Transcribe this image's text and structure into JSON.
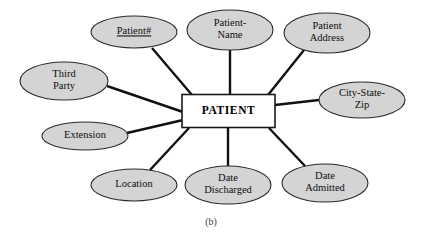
{
  "figure": {
    "caption": "(b)",
    "diagram_type": "entity-relationship-attribute-diagram",
    "colors": {
      "background": "#ffffff",
      "attribute_fill": "#d4d4d4",
      "attribute_stroke": "#2a2a2a",
      "entity_fill": "#ffffff",
      "entity_stroke": "#1a1a1a",
      "connector": "#111111",
      "text": "#0d0d0d"
    }
  },
  "entity": {
    "name": "PATIENT",
    "shape": "rectangle",
    "x": 228.5,
    "y": 111,
    "width": 93,
    "height": 33
  },
  "attributes": [
    {
      "id": "patient-number",
      "lines": [
        "Patient#"
      ],
      "is_key": true,
      "cx": 134,
      "cy": 32,
      "rx": 43,
      "ry": 16
    },
    {
      "id": "patient-name",
      "lines": [
        "Patient-",
        "Name"
      ],
      "is_key": false,
      "cx": 230,
      "cy": 30,
      "rx": 43,
      "ry": 20
    },
    {
      "id": "patient-address",
      "lines": [
        "Patient",
        "Address"
      ],
      "is_key": false,
      "cx": 327,
      "cy": 33,
      "rx": 43,
      "ry": 20
    },
    {
      "id": "city-state-zip",
      "lines": [
        "City-State-",
        "Zip"
      ],
      "is_key": false,
      "cx": 362,
      "cy": 100,
      "rx": 43,
      "ry": 18
    },
    {
      "id": "date-admitted",
      "lines": [
        "Date",
        "Admitted"
      ],
      "is_key": false,
      "cx": 325,
      "cy": 183,
      "rx": 43,
      "ry": 19
    },
    {
      "id": "date-discharged",
      "lines": [
        "Date",
        "Discharged"
      ],
      "is_key": false,
      "cx": 228,
      "cy": 185,
      "rx": 43,
      "ry": 19
    },
    {
      "id": "location",
      "lines": [
        "Location"
      ],
      "is_key": false,
      "cx": 134,
      "cy": 185,
      "rx": 43,
      "ry": 16
    },
    {
      "id": "extension",
      "lines": [
        "Extension"
      ],
      "is_key": false,
      "cx": 85,
      "cy": 136,
      "rx": 43,
      "ry": 14
    },
    {
      "id": "third-party",
      "lines": [
        "Third",
        "Party"
      ],
      "is_key": false,
      "cx": 64,
      "cy": 81,
      "rx": 44,
      "ry": 19
    }
  ],
  "connectors": [
    {
      "id": "conn-patient-number",
      "x1": 152,
      "y1": 48,
      "x2": 192,
      "y2": 95
    },
    {
      "id": "conn-patient-name",
      "x1": 230,
      "y1": 50,
      "x2": 230,
      "y2": 95
    },
    {
      "id": "conn-patient-address",
      "x1": 304,
      "y1": 50,
      "x2": 268,
      "y2": 95
    },
    {
      "id": "conn-city-state-zip",
      "x1": 319,
      "y1": 100,
      "x2": 275,
      "y2": 105
    },
    {
      "id": "conn-date-admitted",
      "x1": 305,
      "y1": 166,
      "x2": 269,
      "y2": 128
    },
    {
      "id": "conn-date-discharged",
      "x1": 228,
      "y1": 166,
      "x2": 228,
      "y2": 128
    },
    {
      "id": "conn-location",
      "x1": 150,
      "y1": 170,
      "x2": 189,
      "y2": 128
    },
    {
      "id": "conn-extension",
      "x1": 127,
      "y1": 133,
      "x2": 183,
      "y2": 120
    },
    {
      "id": "conn-third-party",
      "x1": 107,
      "y1": 86,
      "x2": 183,
      "y2": 112
    }
  ]
}
